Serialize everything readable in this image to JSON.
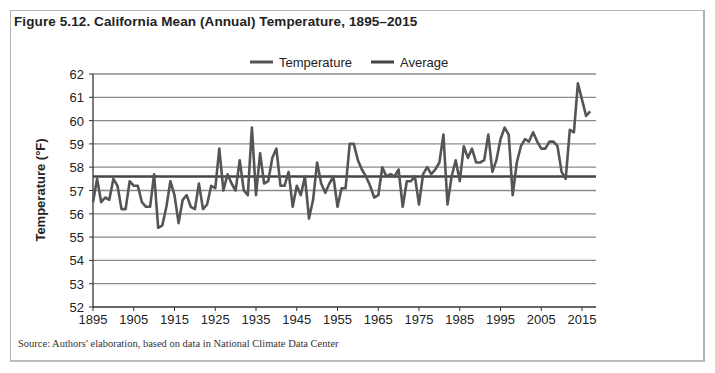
{
  "figure": {
    "title": "Figure 5.12. California Mean (Annual) Temperature, 1895–2015",
    "source": "Source: Authors' elaboration, based on data in National Climate Data Center"
  },
  "legend": {
    "items": [
      {
        "label": "Temperature",
        "color": "#555555"
      },
      {
        "label": "Average",
        "color": "#444444"
      }
    ]
  },
  "axes": {
    "ylabel": "Temperature (°F)",
    "yticks": [
      "62",
      "61",
      "60",
      "59",
      "58",
      "57",
      "56",
      "55",
      "54",
      "53",
      "52"
    ],
    "xticks": [
      "1895",
      "1905",
      "1915",
      "1925",
      "1935",
      "1945",
      "1955",
      "1965",
      "1975",
      "1985",
      "1995",
      "2005",
      "2015"
    ]
  },
  "chart_data": {
    "type": "line",
    "title": "Figure 5.12. California Mean (Annual) Temperature, 1895–2015",
    "xlabel": "",
    "ylabel": "Temperature (°F)",
    "ylim": [
      52,
      62
    ],
    "xlim": [
      1895,
      2018
    ],
    "grid": true,
    "legend_position": "top",
    "x_tick_labels": [
      "1895",
      "1905",
      "1915",
      "1925",
      "1935",
      "1945",
      "1955",
      "1965",
      "1975",
      "1985",
      "1995",
      "2005",
      "2015"
    ],
    "y_tick_labels": [
      "52",
      "53",
      "54",
      "55",
      "56",
      "57",
      "58",
      "59",
      "60",
      "61",
      "62"
    ],
    "series": [
      {
        "name": "Temperature",
        "start_year": 1895,
        "values": [
          56.5,
          57.5,
          56.5,
          56.7,
          56.6,
          57.5,
          57.2,
          56.2,
          56.2,
          57.4,
          57.2,
          57.2,
          56.5,
          56.3,
          56.3,
          57.7,
          55.4,
          55.5,
          56.3,
          57.4,
          56.8,
          55.6,
          56.6,
          56.8,
          56.3,
          56.2,
          57.3,
          56.2,
          56.4,
          57.2,
          57.1,
          58.8,
          57.0,
          57.7,
          57.3,
          57.0,
          58.3,
          57.0,
          56.8,
          59.7,
          56.8,
          58.6,
          57.3,
          57.4,
          58.4,
          58.8,
          57.2,
          57.2,
          57.8,
          56.3,
          57.2,
          56.8,
          57.6,
          55.8,
          56.6,
          58.2,
          57.3,
          56.9,
          57.3,
          57.6,
          56.3,
          57.1,
          57.1,
          59.0,
          59.0,
          58.3,
          57.9,
          57.6,
          57.2,
          56.7,
          56.8,
          58.0,
          57.6,
          57.7,
          57.6,
          57.9,
          56.3,
          57.4,
          57.4,
          57.6,
          56.4,
          57.7,
          58.0,
          57.7,
          57.9,
          58.2,
          59.4,
          56.4,
          57.6,
          58.3,
          57.4,
          58.9,
          58.4,
          58.8,
          58.2,
          58.2,
          58.3,
          59.4,
          57.8,
          58.3,
          59.2,
          59.7,
          59.4,
          56.8,
          58.2,
          58.9,
          59.2,
          59.1,
          59.5,
          59.1,
          58.8,
          58.8,
          59.1,
          59.1,
          58.9,
          57.8,
          57.5,
          59.6,
          59.5,
          61.6,
          60.9,
          60.2,
          60.4
        ]
      },
      {
        "name": "Average",
        "constant": 57.6
      }
    ]
  }
}
